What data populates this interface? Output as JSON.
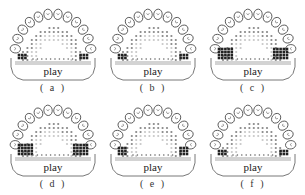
{
  "figure": {
    "panels": [
      {
        "id": "a",
        "label": "( a )",
        "word": "play",
        "level": 1
      },
      {
        "id": "b",
        "label": "( b )",
        "word": "play",
        "level": 1
      },
      {
        "id": "c",
        "label": "( c )",
        "word": "play",
        "level": 3
      },
      {
        "id": "d",
        "label": "( d )",
        "word": "play",
        "level": 3
      },
      {
        "id": "e",
        "label": "( e )",
        "word": "play",
        "level": 2
      },
      {
        "id": "f",
        "label": "( f )",
        "word": "play",
        "level": 1
      }
    ]
  },
  "colors": {
    "tooth_outline": "#444444",
    "dark_contact": "#222222",
    "mid_contact": "#888888",
    "light_contact": "#c8c8c8",
    "palate_outline": "#555555"
  }
}
